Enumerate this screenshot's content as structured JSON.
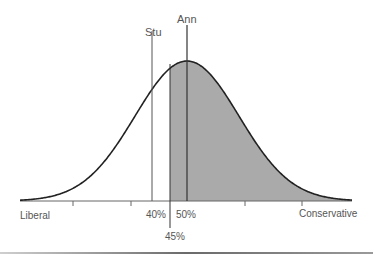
{
  "chart_data": {
    "type": "area",
    "title": "",
    "xlabel_left": "Liberal",
    "xlabel_right": "Conservative",
    "x_range": [
      0,
      100
    ],
    "curve": {
      "distribution": "normal",
      "mean": 50,
      "shape": "bell"
    },
    "shaded_region": {
      "from": 45,
      "to": 100,
      "color": "#aaaaaa"
    },
    "markers": [
      {
        "name": "Stu",
        "x": 40,
        "label_top": "Stu",
        "label_bottom": "40%"
      },
      {
        "name": "Ann",
        "x": 50,
        "label_top": "Ann",
        "label_bottom": "50%"
      },
      {
        "name": "cutoff",
        "x": 45,
        "label_top": "",
        "label_bottom": "45%"
      }
    ],
    "ticks": [
      10,
      25,
      75,
      90
    ],
    "grid": false,
    "legend": null
  },
  "labels": {
    "stu": "Stu",
    "ann": "Ann",
    "pct40": "40%",
    "pct50": "50%",
    "pct45": "45%",
    "liberal": "Liberal",
    "conservative": "Conservative"
  },
  "colors": {
    "curve": "#222222",
    "shade": "#aaaaaa",
    "axis": "#666666",
    "text": "#555555"
  }
}
